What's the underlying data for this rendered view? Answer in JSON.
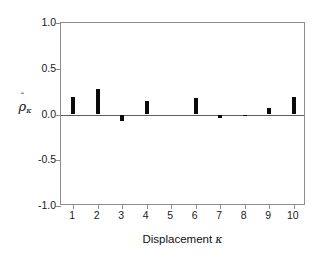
{
  "chart_data": {
    "type": "bar",
    "title": "",
    "subtitle": "",
    "xlabel": "Displacement κ",
    "ylabel": "ρ̂κ",
    "categories": [
      "1",
      "2",
      "3",
      "4",
      "5",
      "6",
      "7",
      "8",
      "9",
      "10"
    ],
    "values": [
      0.19,
      0.28,
      -0.07,
      0.15,
      0.0,
      0.18,
      -0.04,
      -0.02,
      0.07,
      0.19
    ],
    "series": [
      {
        "name": "sample autocorrelation",
        "values": [
          0.19,
          0.28,
          -0.07,
          0.15,
          0.0,
          0.18,
          -0.04,
          -0.02,
          0.07,
          0.19
        ]
      }
    ],
    "ylim": [
      -1.0,
      1.0
    ],
    "xlim": [
      0.5,
      10.5
    ],
    "yticks": [
      1.0,
      0.5,
      0.0,
      -0.5,
      -1.0
    ],
    "ytick_labels": [
      "1.0",
      "0.5",
      "0.0",
      "-0.5",
      "-1.0"
    ],
    "xticks": [
      1,
      2,
      3,
      4,
      5,
      6,
      7,
      8,
      9,
      10
    ],
    "xtick_labels": [
      "1",
      "2",
      "3",
      "4",
      "5",
      "6",
      "7",
      "8",
      "9",
      "10"
    ],
    "grid": false,
    "legend": null,
    "legend_position": "none",
    "annotations": [],
    "bar_color": "#0a0a0a",
    "axis_color": "#8d8d8d",
    "zero_line_color": "#5e5e5e",
    "background_color": "#ffffff"
  },
  "axes": {
    "ylabel_base": "ρ",
    "ylabel_hat": "ˆ",
    "ylabel_sub": "κ",
    "xlabel_text": "Displacement",
    "xlabel_symbol": "κ"
  }
}
